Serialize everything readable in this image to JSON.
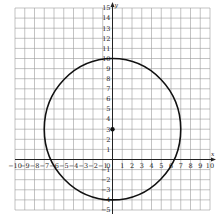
{
  "chart_data": {
    "type": "scatter",
    "title": "",
    "xlabel": "x",
    "ylabel": "y",
    "xlim": [
      -10,
      10
    ],
    "ylim": [
      -5,
      15
    ],
    "grid": true,
    "x_ticks": [
      -10,
      -9,
      -8,
      -7,
      -6,
      -5,
      -4,
      -3,
      -2,
      -1,
      1,
      2,
      3,
      4,
      5,
      6,
      7,
      8,
      9,
      10
    ],
    "y_ticks": [
      -5,
      -4,
      -3,
      -2,
      -1,
      1,
      2,
      3,
      4,
      5,
      6,
      7,
      8,
      9,
      10,
      11,
      12,
      13,
      14,
      15
    ],
    "shapes": [
      {
        "type": "circle",
        "center": [
          0,
          3
        ],
        "radius": 7,
        "color": "#111111"
      }
    ],
    "points": [
      {
        "x": 0,
        "y": 3,
        "label": "center"
      }
    ]
  },
  "labels": {
    "x_axis": "x",
    "y_axis": "y"
  }
}
